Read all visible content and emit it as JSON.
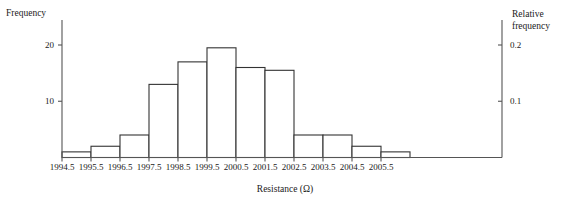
{
  "chart_data": {
    "type": "bar",
    "title": "",
    "subtitle": "",
    "xlabel": "Resistance (Ω)",
    "ylabel": "Frequency",
    "y2label": "Relative frequency",
    "grid": false,
    "legend": "none",
    "bin_width": 1,
    "bin_edges": [
      1994.5,
      1995.5,
      1996.5,
      1997.5,
      1998.5,
      1999.5,
      2000.5,
      2001.5,
      2002.5,
      2003.5,
      2004.5,
      2005.5,
      2006.5
    ],
    "categories": [
      "1994.5-1995.5",
      "1995.5-1996.5",
      "1996.5-1997.5",
      "1997.5-1998.5",
      "1998.5-1999.5",
      "1999.5-2000.5",
      "2000.5-2001.5",
      "2001.5-2002.5",
      "2002.5-2003.5",
      "2003.5-2004.5",
      "2004.5-2005.5",
      "2005.5-2006.5"
    ],
    "values": [
      1,
      2,
      4,
      13,
      17,
      19.5,
      16,
      15.5,
      4,
      4,
      2,
      1
    ],
    "relative_values": [
      0.01,
      0.02,
      0.04,
      0.13,
      0.17,
      0.195,
      0.16,
      0.155,
      0.04,
      0.04,
      0.02,
      0.01
    ],
    "ylim": [
      0,
      22
    ],
    "y2lim": [
      0,
      0.22
    ],
    "xlim": [
      1994.5,
      2006.5
    ],
    "yticks": [
      10,
      20
    ],
    "ytick_labels": [
      "10",
      "20"
    ],
    "y2ticks": [
      0.1,
      0.2
    ],
    "y2tick_labels": [
      "0.1",
      "0.2"
    ],
    "xticks": [
      1994.5,
      1995.5,
      1996.5,
      1997.5,
      1998.5,
      1999.5,
      2000.5,
      2001.5,
      2002.5,
      2003.5,
      2004.5,
      2005.5
    ],
    "xtick_labels": [
      "1994.5",
      "1995.5",
      "1996.5",
      "1997.5",
      "1998.5",
      "1999.5",
      "2000.5",
      "2001.5",
      "2002.5",
      "2003.5",
      "2004.5",
      "2005.5"
    ],
    "colors": {
      "bar_edge": "#333333",
      "bar_fill": "#ffffff",
      "axis": "#555555",
      "text": "#1a1a1a"
    }
  },
  "axes": {
    "left_title": "Frequency",
    "right_title": "Relative frequency",
    "bottom_title": "Resistance (Ω)"
  }
}
